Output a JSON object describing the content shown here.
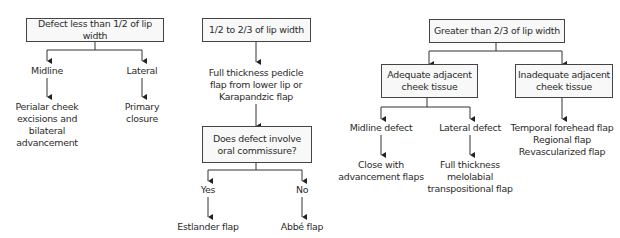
{
  "diagram": {
    "type": "flowchart",
    "branches": [
      {
        "root": "Defect less than 1/2 of lip width",
        "children": [
          {
            "label": "Midline",
            "result": [
              "Perialar cheek",
              "excisions and",
              "bilateral",
              "advancement"
            ]
          },
          {
            "label": "Lateral",
            "result": [
              "Primary",
              "closure"
            ]
          }
        ]
      },
      {
        "root": "1/2 to 2/3 of lip width",
        "step": [
          "Full thickness pedicle",
          "flap from lower lip or",
          "Karapandzic flap"
        ],
        "question": [
          "Does defect involve",
          "oral commissure?"
        ],
        "children": [
          {
            "label": "Yes",
            "result": "Estlander flap"
          },
          {
            "label": "No",
            "result": "Abbé flap"
          }
        ]
      },
      {
        "root": "Greater than 2/3 of lip width",
        "children": [
          {
            "label": [
              "Adequate adjacent",
              "cheek tissue"
            ],
            "children": [
              {
                "label": "Midline defect",
                "result": [
                  "Close with",
                  "advancement flaps"
                ]
              },
              {
                "label": "Lateral defect",
                "result": [
                  "Full thickness",
                  "melolabial",
                  "transpositional flap"
                ]
              }
            ]
          },
          {
            "label": [
              "Inadequate adjacent",
              "cheek tissue"
            ],
            "result": [
              "Temporal forehead flap",
              "Regional flap",
              "Revascularized flap"
            ]
          }
        ]
      }
    ],
    "colors": {
      "line": "#333333",
      "box_border": "#444444",
      "box_fill": "#f8f8f8",
      "text": "#2b2b2b"
    }
  }
}
